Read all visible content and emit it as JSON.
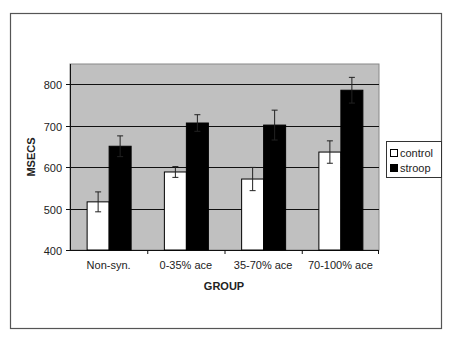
{
  "chart_data": {
    "type": "bar",
    "title": "",
    "xlabel": "GROUP",
    "ylabel": "MSECS",
    "ylim": [
      400,
      850
    ],
    "yticks": [
      400,
      500,
      600,
      700,
      800
    ],
    "grid": true,
    "legend_position": "right",
    "categories": [
      "Non-syn.",
      "0-35% ace",
      "35-70% ace",
      "70-100% ace"
    ],
    "series": [
      {
        "name": "control",
        "color": "#ffffff",
        "values": [
          516,
          588,
          571,
          636
        ],
        "errors": [
          24,
          13,
          28,
          27
        ]
      },
      {
        "name": "stroop",
        "color": "#000000",
        "values": [
          650,
          706,
          701,
          785
        ],
        "errors": [
          25,
          20,
          36,
          31
        ]
      }
    ],
    "plot_background": "#c0c0c0"
  }
}
